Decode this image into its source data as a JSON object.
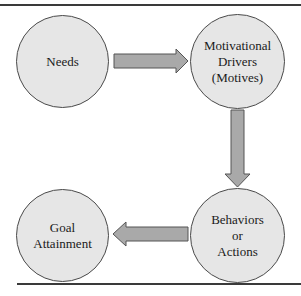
{
  "diagram": {
    "type": "cycle-flow",
    "nodes": [
      {
        "id": "needs",
        "label": "Needs"
      },
      {
        "id": "motives",
        "label": "Motivational\nDrivers\n(Motives)"
      },
      {
        "id": "behaviors",
        "label": "Behaviors\nor\nActions"
      },
      {
        "id": "goal",
        "label": "Goal\nAttainment"
      }
    ],
    "edges": [
      {
        "from": "needs",
        "to": "motives",
        "direction": "right"
      },
      {
        "from": "motives",
        "to": "behaviors",
        "direction": "down"
      },
      {
        "from": "behaviors",
        "to": "goal",
        "direction": "left"
      }
    ],
    "colors": {
      "node_fill": "#e6e6e6",
      "node_stroke": "#4a4a4a",
      "arrow_fill": "#a9a9a9",
      "arrow_stroke": "#555555",
      "rule": "#3a3a3a"
    }
  }
}
